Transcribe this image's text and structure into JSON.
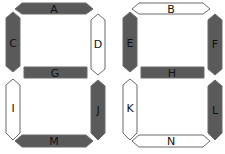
{
  "colors": {
    "filled": "#5a5a5a",
    "empty": "#ffffff",
    "stroke": "#6a6a6a",
    "label": "#111111"
  },
  "digits": [
    {
      "name": "left-digit",
      "segments": {
        "top": {
          "label": "A",
          "filled": true
        },
        "upper_left": {
          "label": "C",
          "filled": true
        },
        "upper_right": {
          "label": "D",
          "filled": false
        },
        "middle": {
          "label": "G",
          "filled": true
        },
        "lower_left": {
          "label": "I",
          "filled": false
        },
        "lower_right": {
          "label": "J",
          "filled": true
        },
        "bottom": {
          "label": "M",
          "filled": true
        }
      }
    },
    {
      "name": "right-digit",
      "segments": {
        "top": {
          "label": "B",
          "filled": false
        },
        "upper_left": {
          "label": "E",
          "filled": true
        },
        "upper_right": {
          "label": "F",
          "filled": true
        },
        "middle": {
          "label": "H",
          "filled": true
        },
        "lower_left": {
          "label": "K",
          "filled": false
        },
        "lower_right": {
          "label": "L",
          "filled": true
        },
        "bottom": {
          "label": "N",
          "filled": false
        }
      }
    }
  ]
}
